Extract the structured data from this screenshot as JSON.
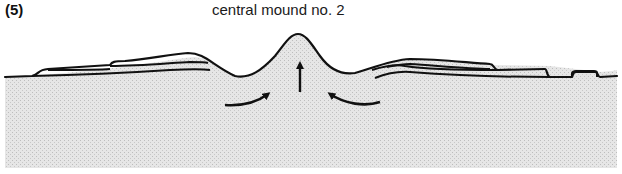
{
  "figure": {
    "panel_label": "(5)",
    "title": "central mound no. 2"
  },
  "diagram": {
    "elements": [
      {
        "name": "central-mound",
        "type": "peak"
      },
      {
        "name": "left-flank-layers",
        "type": "strata",
        "count": 3
      },
      {
        "name": "right-flank-layers",
        "type": "strata",
        "count": 3
      },
      {
        "name": "small-right-block",
        "type": "strata",
        "count": 1
      },
      {
        "name": "uplift-arrow",
        "direction": "up"
      },
      {
        "name": "inflow-arrow-left",
        "direction": "curved-up-right"
      },
      {
        "name": "inflow-arrow-right",
        "direction": "curved-up-left"
      }
    ],
    "colors": {
      "line": "#111111",
      "fill": "#e4e4e4",
      "background": "#ffffff"
    }
  }
}
